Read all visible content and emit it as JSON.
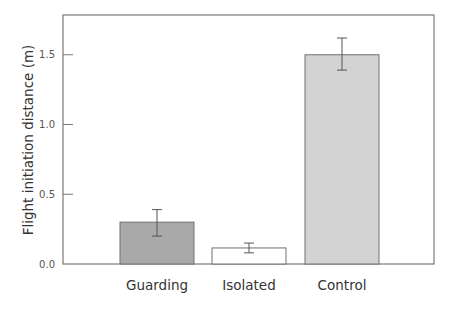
{
  "chart_data": {
    "type": "bar",
    "title": "",
    "xlabel": "",
    "ylabel": "Flight initiation distance (m)",
    "categories": [
      "Guarding",
      "Isolated",
      "Control"
    ],
    "values": [
      0.3,
      0.115,
      1.5
    ],
    "error_low": [
      0.2,
      0.08,
      1.39
    ],
    "error_high": [
      0.39,
      0.15,
      1.62
    ],
    "bar_colors": [
      "#a9a9a9",
      "#ffffff",
      "#d3d3d3"
    ],
    "ylim": [
      0,
      1.75
    ],
    "yticks": [
      0.0,
      0.5,
      1.0,
      1.5
    ],
    "ytick_labels": [
      "0.0",
      "0.5",
      "1.0",
      "1.5"
    ],
    "grid": false,
    "legend": null
  },
  "layout": {
    "frame_color": "#7a7a7a",
    "bar_edge_color": "#707070"
  }
}
